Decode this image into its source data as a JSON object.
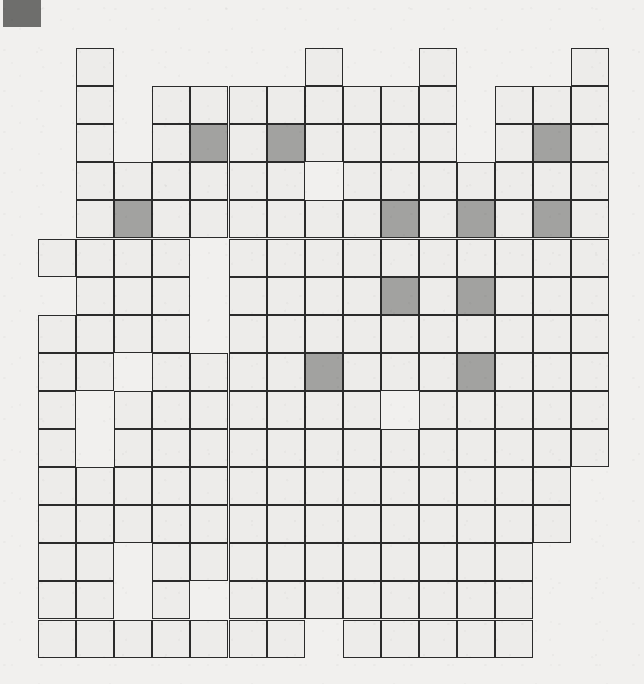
{
  "page": {
    "background_color": "#f1f0ee",
    "width": 644,
    "height": 684
  },
  "corner_mark": {
    "name": "scan-corner-marker",
    "x": 3,
    "y": 0,
    "width": 38,
    "height": 27,
    "color": "#6e6e6c"
  },
  "grid": {
    "origin_x": 38,
    "origin_y": 48,
    "cell_size": 38.1,
    "columns": 15,
    "rows": 16,
    "line_color": "#2b2b2b",
    "cell_color": "#edecea",
    "shaded_color": "#a2a2a0",
    "legend": "1 = open cell, 2 = shaded cell, 0 = no cell",
    "map": [
      [
        0,
        1,
        0,
        0,
        0,
        0,
        0,
        1,
        0,
        0,
        1,
        0,
        0,
        0,
        1
      ],
      [
        0,
        1,
        0,
        1,
        1,
        1,
        1,
        1,
        1,
        1,
        1,
        0,
        1,
        1,
        1
      ],
      [
        0,
        1,
        0,
        1,
        2,
        1,
        2,
        1,
        1,
        1,
        1,
        0,
        1,
        2,
        1
      ],
      [
        0,
        1,
        1,
        1,
        1,
        1,
        1,
        0,
        1,
        1,
        1,
        1,
        1,
        1,
        1
      ],
      [
        0,
        1,
        2,
        1,
        1,
        1,
        1,
        1,
        1,
        2,
        1,
        2,
        1,
        2,
        1
      ],
      [
        1,
        1,
        1,
        1,
        0,
        1,
        1,
        1,
        1,
        1,
        1,
        1,
        1,
        1,
        1
      ],
      [
        0,
        1,
        1,
        1,
        0,
        1,
        1,
        1,
        1,
        2,
        1,
        2,
        1,
        1,
        1
      ],
      [
        1,
        1,
        1,
        1,
        0,
        1,
        1,
        1,
        1,
        1,
        1,
        1,
        1,
        1,
        1
      ],
      [
        1,
        1,
        0,
        1,
        1,
        1,
        1,
        2,
        1,
        1,
        1,
        2,
        1,
        1,
        1
      ],
      [
        1,
        0,
        1,
        1,
        1,
        1,
        1,
        1,
        1,
        0,
        1,
        1,
        1,
        1,
        1
      ],
      [
        1,
        0,
        1,
        1,
        1,
        1,
        1,
        1,
        1,
        1,
        1,
        1,
        1,
        1,
        1
      ],
      [
        1,
        1,
        1,
        1,
        1,
        1,
        1,
        1,
        1,
        1,
        1,
        1,
        1,
        1,
        0
      ],
      [
        1,
        1,
        1,
        1,
        1,
        1,
        1,
        1,
        1,
        1,
        1,
        1,
        1,
        1,
        0
      ],
      [
        1,
        1,
        0,
        1,
        1,
        1,
        1,
        1,
        1,
        1,
        1,
        1,
        1,
        0,
        0
      ],
      [
        1,
        1,
        0,
        1,
        0,
        1,
        1,
        1,
        1,
        1,
        1,
        1,
        1,
        0,
        0
      ],
      [
        1,
        1,
        1,
        1,
        1,
        1,
        1,
        0,
        1,
        1,
        1,
        1,
        1,
        0,
        0
      ]
    ]
  }
}
